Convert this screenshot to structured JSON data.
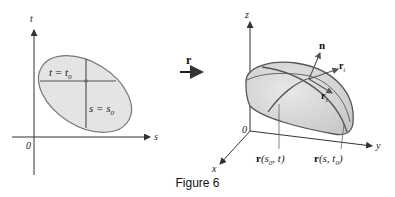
{
  "figure": {
    "caption": "Figure 6",
    "mapping_label": "r"
  },
  "parameter_domain": {
    "axes": {
      "horizontal": "s",
      "vertical": "t",
      "origin": "0"
    },
    "lines": {
      "horizontal": "t = t",
      "horizontal_sub": "0",
      "vertical": "s = s",
      "vertical_sub": "0"
    }
  },
  "surface_space": {
    "axes": {
      "x": "x",
      "y": "y",
      "z": "z",
      "origin": "0"
    },
    "vectors": {
      "normal": "n",
      "r_t": "r",
      "r_t_sub": "t",
      "r_s": "r",
      "r_s_sub": "s"
    },
    "curves": {
      "grid_curve_1": {
        "prefix": "r",
        "args": "(s",
        "sub": "0",
        "rest": ", t)"
      },
      "grid_curve_2": {
        "prefix": "r",
        "args": "(s, t",
        "sub": "0",
        "rest": ")"
      }
    }
  },
  "colors": {
    "region_fill": "#e4e4e4",
    "outline": "#555555",
    "axis": "#333333"
  }
}
